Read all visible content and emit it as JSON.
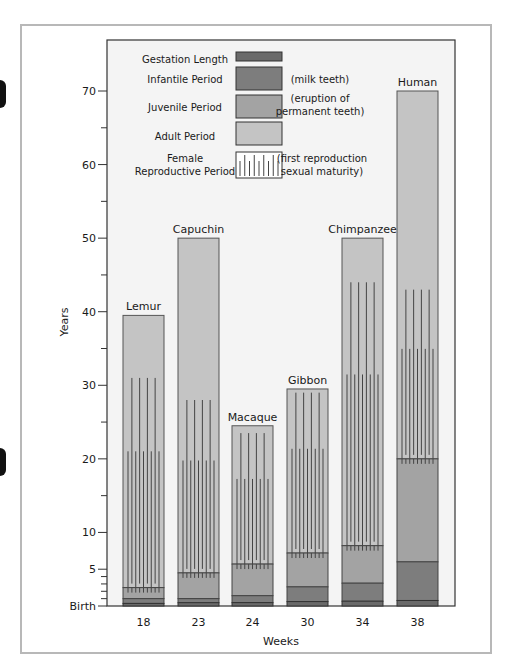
{
  "chart_data": {
    "type": "bar",
    "subtype": "stacked-bar-with-overlay",
    "title": "",
    "xlabel": "Weeks",
    "ylabel": "Years",
    "ylim": [
      0,
      70
    ],
    "y_ticks": [
      {
        "value": 0,
        "label": "Birth"
      },
      {
        "value": 5,
        "label": "5"
      },
      {
        "value": 10,
        "label": "10"
      },
      {
        "value": 20,
        "label": "20"
      },
      {
        "value": 30,
        "label": "30"
      },
      {
        "value": 40,
        "label": "40"
      },
      {
        "value": 50,
        "label": "50"
      },
      {
        "value": 60,
        "label": "60"
      },
      {
        "value": 70,
        "label": "70"
      }
    ],
    "categories": [
      "18",
      "23",
      "24",
      "30",
      "34",
      "38"
    ],
    "species": [
      "Lemur",
      "Capuchin",
      "Macaque",
      "Gibbon",
      "Chimpanzee",
      "Human"
    ],
    "series": [
      {
        "name": "Gestation Length",
        "color": "#6a6a6a",
        "values": [
          0.35,
          0.45,
          0.46,
          0.6,
          0.65,
          0.75
        ]
      },
      {
        "name": "Infantile Period",
        "note": "(milk teeth)",
        "color": "#7d7d7d",
        "end_values": [
          1.0,
          1.0,
          1.4,
          2.6,
          3.1,
          6.0
        ]
      },
      {
        "name": "Juvenile Period",
        "note": "(eruption of permanent teeth)",
        "color": "#a3a3a3",
        "end_values": [
          2.5,
          4.5,
          5.7,
          7.2,
          8.2,
          20.0
        ]
      },
      {
        "name": "Adult Period",
        "color": "#c4c4c4",
        "end_values": [
          39.5,
          50,
          24.5,
          29.5,
          50,
          70
        ]
      },
      {
        "name": "Female Reproductive Period",
        "note": "(first reproduction sexual maturity)",
        "pattern": "vertical-lines",
        "ranges": [
          [
            2.5,
            31
          ],
          [
            4.5,
            28
          ],
          [
            5.7,
            23.5
          ],
          [
            7.2,
            29
          ],
          [
            8.2,
            44
          ],
          [
            20,
            43
          ]
        ]
      }
    ],
    "legend_position": "top-left inside plot",
    "grid": false
  },
  "legend": [
    {
      "label": "Gestation Length",
      "note": ""
    },
    {
      "label": "Infantile Period",
      "note": "(milk teeth)"
    },
    {
      "label": "Juvenile Period",
      "note_line1": "(eruption of",
      "note_line2": "permanent teeth)"
    },
    {
      "label": "Adult Period",
      "note": ""
    },
    {
      "label_line1": "Female",
      "label_line2": "Reproductive Period",
      "note_line1": "(first reproduction",
      "note_line2": "sexual maturity)"
    }
  ],
  "axis": {
    "y_label": "Years",
    "x_label": "Weeks",
    "birth_label": "Birth"
  }
}
